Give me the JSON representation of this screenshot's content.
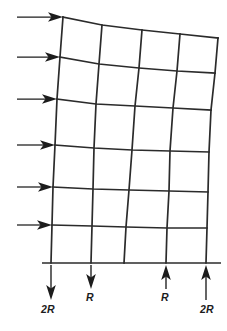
{
  "figure": {
    "type": "structural-frame-diagram",
    "bays": 4,
    "stories": 6,
    "colors": {
      "member": "#2b2b2b",
      "arrow": "#1c1c1c",
      "background": "#ffffff"
    }
  },
  "lateral_loads": {
    "count": 6,
    "direction": "right",
    "arrows": [
      {
        "name": "lateral-load-level-6",
        "x1": 17,
        "x2": 63,
        "y": 17
      },
      {
        "name": "lateral-load-level-5",
        "x1": 17,
        "x2": 60,
        "y": 57
      },
      {
        "name": "lateral-load-level-4",
        "x1": 17,
        "x2": 57,
        "y": 99
      },
      {
        "name": "lateral-load-level-3",
        "x1": 17,
        "x2": 55,
        "y": 145
      },
      {
        "name": "lateral-load-level-2",
        "x1": 17,
        "x2": 53,
        "y": 187
      },
      {
        "name": "lateral-load-level-1",
        "x1": 17,
        "x2": 52,
        "y": 225
      }
    ]
  },
  "base_reactions": [
    {
      "name": "reaction-left-outer",
      "label": "2R",
      "x": 51,
      "direction": "down",
      "label_x": 48,
      "label_y": 313
    },
    {
      "name": "reaction-left-inner",
      "label": "R",
      "x": 91,
      "direction": "down",
      "label_x": 90,
      "label_y": 301
    },
    {
      "name": "reaction-right-inner",
      "label": "R",
      "x": 166,
      "direction": "up",
      "label_x": 165,
      "label_y": 301
    },
    {
      "name": "reaction-right-outer",
      "label": "2R",
      "x": 206,
      "direction": "up",
      "label_x": 207,
      "label_y": 313
    }
  ],
  "geometry": {
    "ground": {
      "x1": 42,
      "x2": 221,
      "y": 263
    },
    "columns": [
      {
        "name": "column-1",
        "points": "63,17 60,57 57,99 55,145 53,187 52,225 51,263"
      },
      {
        "name": "column-2",
        "points": "102,25 99,64 96,104 94,148 93,189 92,226 91,263"
      },
      {
        "name": "column-3",
        "points": "142,30 139,68 135,106 132,150 129,190 126,227 124,263"
      },
      {
        "name": "column-4",
        "points": "180,34 177,71 173,108 170,151 169,191 167,228 166,263"
      },
      {
        "name": "column-5",
        "points": "218,38 215,73 211,110 209,152 208,192 207,228 206,263"
      }
    ],
    "beams": [
      {
        "name": "beam-level-6",
        "points": "63,17 102,25 142,30 180,34 218,38"
      },
      {
        "name": "beam-level-5",
        "points": "60,57 99,64 139,68 177,71 215,73"
      },
      {
        "name": "beam-level-4",
        "points": "57,99 96,104 135,106 173,108 211,110"
      },
      {
        "name": "beam-level-3",
        "points": "55,145 94,148 132,150 170,151 209,152"
      },
      {
        "name": "beam-level-2",
        "points": "53,187 93,189 129,190 169,191 208,192"
      },
      {
        "name": "beam-level-1",
        "points": "52,225 92,226 126,227 167,228 207,228"
      }
    ]
  }
}
